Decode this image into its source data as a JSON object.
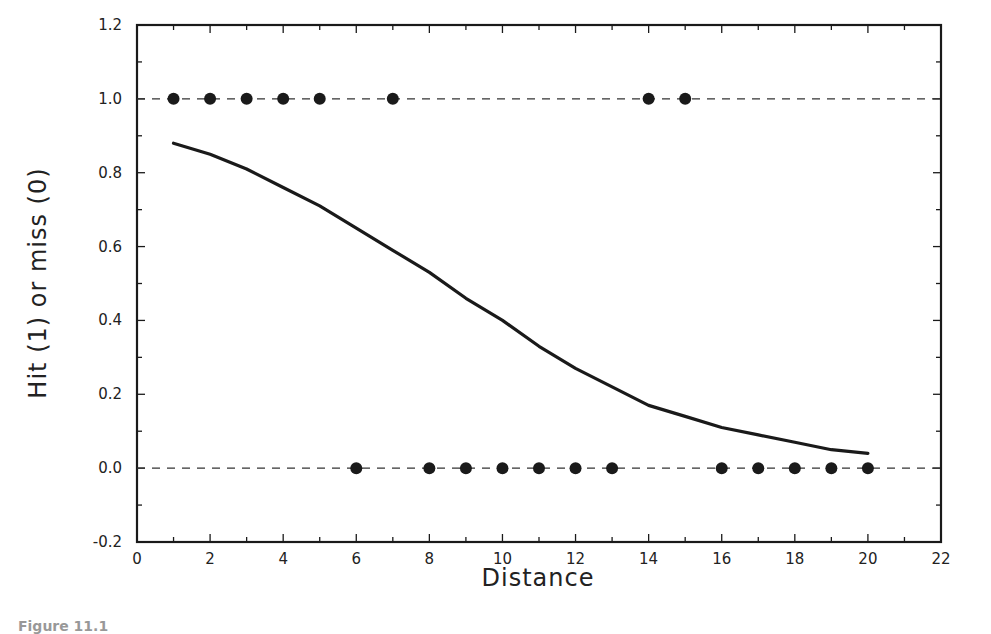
{
  "chart_data": {
    "type": "scatter",
    "title": "",
    "xlabel": "Distance",
    "ylabel": "Hit (1) or miss (0)",
    "xlim": [
      0,
      22
    ],
    "ylim": [
      -0.2,
      1.2
    ],
    "x_ticks": [
      0,
      2,
      4,
      6,
      8,
      10,
      12,
      14,
      16,
      18,
      20,
      22
    ],
    "y_ticks": [
      -0.2,
      0.0,
      0.2,
      0.4,
      0.6,
      0.8,
      1.0,
      1.2
    ],
    "y_tick_labels": [
      "-0.2",
      "0.0",
      "0.2",
      "0.4",
      "0.6",
      "0.8",
      "1.0",
      "1.2"
    ],
    "grid": false,
    "reference_lines": [
      {
        "y": 1.0,
        "style": "dashed"
      },
      {
        "y": 0.0,
        "style": "dashed"
      }
    ],
    "series": [
      {
        "name": "Observed hits/misses",
        "type": "scatter",
        "marker": "filled-circle",
        "x": [
          1,
          2,
          3,
          4,
          5,
          6,
          7,
          8,
          9,
          10,
          11,
          12,
          13,
          14,
          15,
          16,
          17,
          18,
          19,
          20
        ],
        "y": [
          1,
          1,
          1,
          1,
          1,
          0,
          1,
          0,
          0,
          0,
          0,
          0,
          0,
          1,
          1,
          0,
          0,
          0,
          0,
          0
        ]
      },
      {
        "name": "Fitted logistic curve",
        "type": "line",
        "style": "solid",
        "x": [
          1,
          2,
          3,
          4,
          5,
          6,
          7,
          8,
          9,
          10,
          11,
          12,
          13,
          14,
          15,
          16,
          17,
          18,
          19,
          20
        ],
        "y": [
          0.88,
          0.85,
          0.81,
          0.76,
          0.71,
          0.65,
          0.59,
          0.53,
          0.46,
          0.4,
          0.33,
          0.27,
          0.22,
          0.17,
          0.14,
          0.11,
          0.09,
          0.07,
          0.05,
          0.04
        ]
      }
    ],
    "legend": null
  },
  "caption_fragment": "Figure 11.1"
}
